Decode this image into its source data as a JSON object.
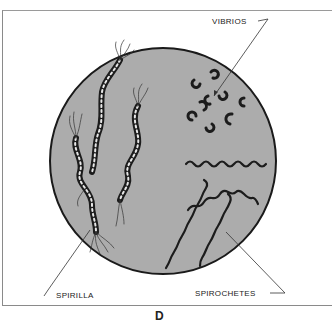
{
  "diagram": {
    "type": "illustration",
    "labels": {
      "vibrios": "VIBRIOS",
      "spirilla": "SPIRILLA",
      "spirochetes": "SPIROCHETES"
    },
    "caption": "D",
    "colors": {
      "field": "#acacac",
      "outline": "#1a1a1a",
      "background": "#ffffff"
    }
  }
}
